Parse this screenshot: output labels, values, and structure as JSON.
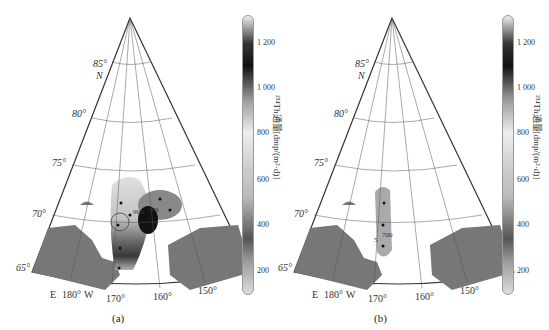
{
  "panels": [
    {
      "id": "a",
      "caption": "(a)",
      "lat_labels": [
        "85°",
        "N",
        "80°",
        "75°",
        "70°",
        "65°"
      ],
      "lon_labels": [
        "E",
        "180°",
        "W",
        "170°",
        "160°",
        "150°"
      ],
      "contour_labels": [
        "900",
        "700"
      ]
    },
    {
      "id": "b",
      "caption": "(b)",
      "lat_labels": [
        "85°",
        "N",
        "80°",
        "75°",
        "70°",
        "65°"
      ],
      "lon_labels": [
        "E",
        "180°",
        "W",
        "170°",
        "160°",
        "150°"
      ],
      "contour_labels": [
        "700",
        "5"
      ]
    }
  ],
  "colorbar": {
    "title": "²³⁴Th通量[dmp/(m²·d)]",
    "ticks": [
      "1 200",
      "1 000",
      "800",
      "600",
      "400",
      "200"
    ]
  }
}
